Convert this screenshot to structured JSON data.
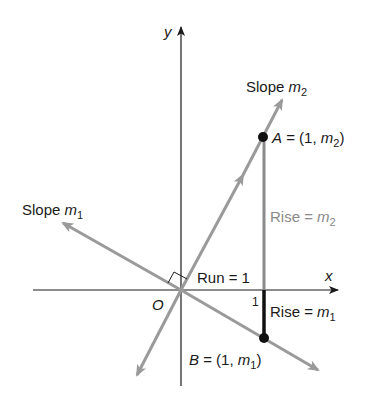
{
  "diagram": {
    "axes": {
      "x_label": "x",
      "y_label": "y",
      "origin_label": "O",
      "tick_label": "1"
    },
    "lines": {
      "m1": {
        "label_prefix": "Slope ",
        "label_var": "m",
        "label_sub": "1"
      },
      "m2": {
        "label_prefix": "Slope ",
        "label_var": "m",
        "label_sub": "2"
      }
    },
    "points": {
      "A": {
        "name": "A",
        "text_eq": " = (1, ",
        "var": "m",
        "sub": "2",
        "close": ")"
      },
      "B": {
        "name": "B",
        "text_eq": " = (1, ",
        "var": "m",
        "sub": "1",
        "close": ")"
      }
    },
    "annotations": {
      "run": "Run = 1",
      "rise2_prefix": "Rise = ",
      "rise2_var": "m",
      "rise2_sub": "2",
      "rise1_prefix": "Rise = ",
      "rise1_var": "m",
      "rise1_sub": "1"
    },
    "colors": {
      "axis": "#1a1a1a",
      "slope_lines": "#9a9a9a",
      "rise_m2_segment": "#8a8a8a",
      "rise_m1_segment": "#111111",
      "point": "#111111"
    }
  }
}
